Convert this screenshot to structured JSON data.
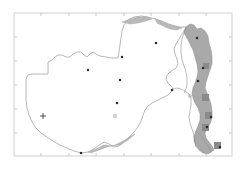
{
  "figure": {
    "type": "map",
    "title": "",
    "background_color": "#ffffff",
    "frame_color": "#cfcfcf",
    "frame_box": {
      "x": 14,
      "y": 13,
      "width": 218,
      "height": 143
    },
    "tick_color": "#bdbdbd"
  },
  "axes": {
    "x_ticks": [
      41,
      69,
      96,
      124,
      151,
      179,
      206
    ],
    "y_ticks": [
      37,
      61,
      85,
      109,
      133
    ],
    "x_tick_labels": [],
    "y_tick_labels": []
  },
  "layers": {
    "country_outline": {
      "name": "zambia-outline",
      "stroke": "#8f8f8f",
      "fill": "none",
      "stroke_width": 0.6
    },
    "highlight_region": {
      "name": "malawi-highlight",
      "fill": "#a9a9a9",
      "stroke": "#8a8a8a",
      "stroke_width": 0.5,
      "label": "shaded study area"
    },
    "dark_patches": {
      "name": "dark-cell-patches",
      "fill": "#8a8a8a",
      "count": 5
    },
    "lakes": {
      "name": "lake-shading",
      "fill": "#b9b9b9",
      "stroke": "#9a9a9a"
    }
  },
  "markers": {
    "solid_points": {
      "style": "filled-square",
      "color": "#2b2b2b",
      "size": 2.2,
      "points": [
        {
          "name": "site-1",
          "x": 156,
          "y": 43
        },
        {
          "name": "site-2",
          "x": 122,
          "y": 57
        },
        {
          "name": "site-3",
          "x": 120,
          "y": 80
        },
        {
          "name": "site-4",
          "x": 88,
          "y": 70
        },
        {
          "name": "site-5",
          "x": 117,
          "y": 103
        },
        {
          "name": "site-6",
          "x": 172,
          "y": 90
        },
        {
          "name": "site-7",
          "x": 81,
          "y": 153
        },
        {
          "name": "site-8",
          "x": 197,
          "y": 38
        },
        {
          "name": "site-9",
          "x": 203,
          "y": 68
        },
        {
          "name": "site-10",
          "x": 198,
          "y": 81
        },
        {
          "name": "site-11",
          "x": 211,
          "y": 117
        },
        {
          "name": "site-12",
          "x": 207,
          "y": 127
        },
        {
          "name": "site-13",
          "x": 220,
          "y": 147
        }
      ]
    },
    "open_points": {
      "style": "open-square",
      "color": "#9a9a9a",
      "size": 2.2,
      "points": [
        {
          "name": "open-site-1",
          "x": 115,
          "y": 116
        },
        {
          "name": "open-site-2",
          "x": 190,
          "y": 96
        }
      ]
    },
    "cross_points": {
      "style": "plus",
      "color": "#2b2b2b",
      "size": 3,
      "points": [
        {
          "name": "cross-site-1",
          "x": 43,
          "y": 116
        }
      ]
    }
  }
}
